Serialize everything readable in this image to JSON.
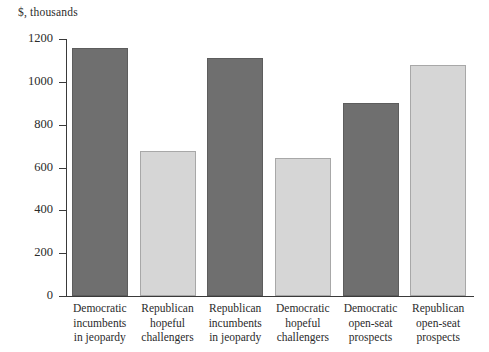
{
  "chart_data": {
    "type": "bar",
    "title": "",
    "subtitle": "",
    "xlabel": "",
    "ylabel": "$, thousands",
    "ylim": [
      0,
      1200
    ],
    "ytick_labels": [
      "1200",
      "1000",
      "800",
      "600",
      "400",
      "200",
      "0"
    ],
    "ytick_values": [
      1200,
      1000,
      800,
      600,
      400,
      200,
      0
    ],
    "grid": false,
    "legend": "none",
    "categories": [
      "Democratic incumbents in jeopardy",
      "Republican hopeful challengers",
      "Republican incumbents in jeopardy",
      "Democratic hopeful challengers",
      "Democratic open-seat prospects",
      "Republican open-seat prospects"
    ],
    "category_lines": [
      [
        "Democratic",
        "incumbents",
        "in jeopardy"
      ],
      [
        "Republican",
        "hopeful",
        "challengers"
      ],
      [
        "Republican",
        "incumbents",
        "in jeopardy"
      ],
      [
        "Democratic",
        "hopeful",
        "challengers"
      ],
      [
        "Democratic",
        "open-seat",
        "prospects"
      ],
      [
        "Republican",
        "open-seat",
        "prospects"
      ]
    ],
    "values": [
      1160,
      675,
      1110,
      645,
      900,
      1080
    ],
    "bar_colors": [
      "dark",
      "light",
      "dark",
      "light",
      "dark",
      "light"
    ],
    "colors": {
      "dark_bar": "#6f6f6f",
      "dark_bar_border": "#5d5d5d",
      "light_bar": "#d6d6d6",
      "light_bar_border": "#a8a8a8",
      "axis": "#3a3a3a",
      "text": "#2b2b2b",
      "background": "#ffffff"
    }
  }
}
